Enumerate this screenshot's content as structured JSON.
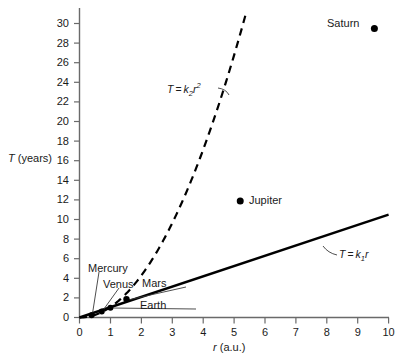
{
  "chart_data": {
    "type": "scatter",
    "title": "",
    "xlabel": "r (a.u.)",
    "ylabel": "T (years)",
    "xlim": [
      0,
      10.2
    ],
    "ylim": [
      0,
      31.5
    ],
    "xticks": [
      "0",
      "1",
      "2",
      "3",
      "4",
      "5",
      "6",
      "7",
      "8",
      "9",
      "10"
    ],
    "xtick_values": [
      0,
      1,
      2,
      3,
      4,
      5,
      6,
      7,
      8,
      9,
      10
    ],
    "yticks": [
      "0",
      "2",
      "4",
      "6",
      "8",
      "10",
      "12",
      "14",
      "16",
      "18",
      "20",
      "22",
      "24",
      "26",
      "28",
      "30"
    ],
    "ytick_values": [
      0,
      2,
      4,
      6,
      8,
      10,
      12,
      14,
      16,
      18,
      20,
      22,
      24,
      26,
      28,
      30
    ],
    "grid": false,
    "legend": "none",
    "points": [
      {
        "name": "Mercury",
        "x": 0.39,
        "y": 0.24
      },
      {
        "name": "Venus",
        "x": 0.72,
        "y": 0.62
      },
      {
        "name": "Earth",
        "x": 1.0,
        "y": 1.0
      },
      {
        "name": "Mars",
        "x": 1.52,
        "y": 1.88
      },
      {
        "name": "Jupiter",
        "x": 5.2,
        "y": 11.9
      },
      {
        "name": "Saturn",
        "x": 9.54,
        "y": 29.5
      }
    ],
    "series": [
      {
        "name": "T = k1r",
        "style": "solid",
        "model": "linear",
        "coefficient": 1.05,
        "annotation": "T = k₁r"
      },
      {
        "name": "T = k2r^2",
        "style": "dashed",
        "model": "quadratic",
        "coefficient": 1.07,
        "annotation": "T = k₂r²"
      }
    ],
    "annotations": [
      {
        "text": "Mercury",
        "target": "Mercury"
      },
      {
        "text": "Venus",
        "target": "Venus"
      },
      {
        "text": "Earth",
        "target": "Earth"
      },
      {
        "text": "Mars",
        "target": "Mars"
      },
      {
        "text": "Jupiter",
        "target": "Jupiter"
      },
      {
        "text": "Saturn",
        "target": "Saturn"
      }
    ],
    "colors": {
      "axis": "#5a5a5a",
      "curve": "#000000",
      "point": "#000000",
      "text": "#1a1a1a",
      "background": "#ffffff"
    }
  },
  "axes": {
    "y_title_symbol": "T",
    "y_title_unit": "(years)",
    "x_title_symbol": "r",
    "x_title_unit": "(a.u.)"
  },
  "equations": {
    "quadratic": {
      "lhs": "T",
      "eq": "=",
      "coef": "k",
      "coef_sub": "2",
      "var": "r",
      "exp": "2"
    },
    "linear": {
      "lhs": "T",
      "eq": "=",
      "coef": "k",
      "coef_sub": "1",
      "var": "r"
    }
  },
  "labels": {
    "mercury": "Mercury",
    "venus": "Venus",
    "earth": "Earth",
    "mars": "Mars",
    "jupiter": "Jupiter",
    "saturn": "Saturn"
  }
}
